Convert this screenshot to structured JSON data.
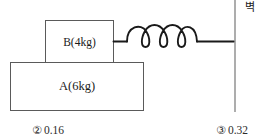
{
  "figure": {
    "type": "physics-diagram",
    "blocks": [
      {
        "id": "B",
        "label": "B(4kg)",
        "mass_kg": 4,
        "position": "top"
      },
      {
        "id": "A",
        "label": "A(6kg)",
        "mass_kg": 6,
        "position": "bottom"
      }
    ],
    "wall": {
      "label": "벽",
      "meaning": "wall"
    },
    "spring": {
      "coils": 3,
      "connects_from": "B(4kg)",
      "connects_to": "wall"
    },
    "colors": {
      "stroke": "#5a5a5a",
      "spring_stroke": "#1a1a1a",
      "wall_stroke": "#8a8a8a",
      "text": "#1a1a1a",
      "background": "#ffffff"
    }
  },
  "options": [
    {
      "marker": "②",
      "value": "0.16"
    },
    {
      "marker": "③",
      "value": "0.32"
    }
  ]
}
